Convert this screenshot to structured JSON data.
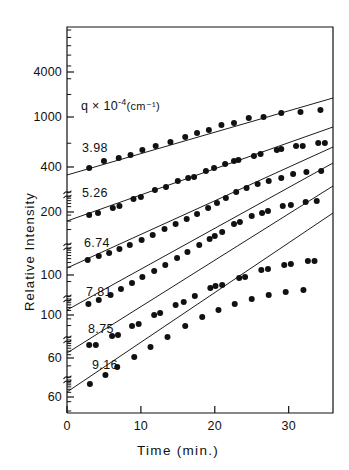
{
  "figure": {
    "background_color": "#ffffff",
    "ink_color": "#111111"
  },
  "chart_data": {
    "type": "scatter",
    "title": "",
    "subtitle": "",
    "xlabel": "Time   (min.)",
    "ylabel": "Relative  Intensity",
    "legend_header": "q × 10⁻⁴ (cm⁻¹)",
    "legend_position": "inside-upper-left",
    "grid": false,
    "yscale": "log-stacked-offset",
    "xscale": "linear",
    "xlim": [
      0,
      36
    ],
    "x_ticks": [
      0,
      10,
      20,
      30
    ],
    "x_tick_labels": [
      "0",
      "10",
      "20",
      "30"
    ],
    "y_tick_labels": [
      "4000",
      "1000",
      "400",
      "200",
      "100",
      "100",
      "60",
      "60"
    ],
    "y_tick_pixel_y": [
      72,
      117,
      167,
      212,
      275,
      315,
      358,
      397
    ],
    "axis_break_pixel_y": [
      192,
      244,
      296,
      337,
      377
    ],
    "series": [
      {
        "name": "3.98",
        "label": "3.98",
        "q_value": 3.98,
        "fit_line": {
          "x0": 0,
          "y0_px": 175,
          "x1": 36,
          "y1_px": 98
        },
        "points": [
          {
            "x": 3.0,
            "y_px": 168
          },
          {
            "x": 5.0,
            "y_px": 161
          },
          {
            "x": 7.0,
            "y_px": 158
          },
          {
            "x": 8.6,
            "y_px": 155
          },
          {
            "x": 10.2,
            "y_px": 150
          },
          {
            "x": 12.0,
            "y_px": 146
          },
          {
            "x": 14.0,
            "y_px": 142
          },
          {
            "x": 16.0,
            "y_px": 137
          },
          {
            "x": 17.6,
            "y_px": 133
          },
          {
            "x": 19.2,
            "y_px": 130
          },
          {
            "x": 20.9,
            "y_px": 125
          },
          {
            "x": 22.6,
            "y_px": 123
          },
          {
            "x": 24.6,
            "y_px": 118
          },
          {
            "x": 26.6,
            "y_px": 117
          },
          {
            "x": 29.0,
            "y_px": 113
          },
          {
            "x": 31.6,
            "y_px": 112
          },
          {
            "x": 34.3,
            "y_px": 110
          }
        ]
      },
      {
        "name": "5.26",
        "label": "5.26",
        "q_value": 5.26,
        "fit_line": {
          "x0": 0,
          "y0_px": 221,
          "x1": 36,
          "y1_px": 127
        },
        "points": [
          {
            "x": 3.0,
            "y_px": 215
          },
          {
            "x": 4.2,
            "y_px": 213
          },
          {
            "x": 6.2,
            "y_px": 208
          },
          {
            "x": 7.1,
            "y_px": 206
          },
          {
            "x": 9.0,
            "y_px": 199
          },
          {
            "x": 10.0,
            "y_px": 197
          },
          {
            "x": 11.9,
            "y_px": 190
          },
          {
            "x": 13.4,
            "y_px": 187
          },
          {
            "x": 15.0,
            "y_px": 181
          },
          {
            "x": 16.4,
            "y_px": 178
          },
          {
            "x": 17.2,
            "y_px": 177
          },
          {
            "x": 18.8,
            "y_px": 171
          },
          {
            "x": 19.9,
            "y_px": 168
          },
          {
            "x": 21.4,
            "y_px": 164
          },
          {
            "x": 22.6,
            "y_px": 161
          },
          {
            "x": 23.2,
            "y_px": 160
          },
          {
            "x": 25.3,
            "y_px": 156
          },
          {
            "x": 26.2,
            "y_px": 154
          },
          {
            "x": 28.4,
            "y_px": 150
          },
          {
            "x": 29.0,
            "y_px": 149
          },
          {
            "x": 31.0,
            "y_px": 146
          },
          {
            "x": 31.9,
            "y_px": 146
          },
          {
            "x": 34.0,
            "y_px": 143
          },
          {
            "x": 34.9,
            "y_px": 143
          }
        ]
      },
      {
        "name": "6.74",
        "label": "6.74",
        "q_value": 6.74,
        "fit_line": {
          "x0": 0,
          "y0_px": 268,
          "x1": 36,
          "y1_px": 147
        },
        "points": [
          {
            "x": 2.8,
            "y_px": 260
          },
          {
            "x": 4.3,
            "y_px": 256
          },
          {
            "x": 5.7,
            "y_px": 253
          },
          {
            "x": 7.1,
            "y_px": 249
          },
          {
            "x": 8.5,
            "y_px": 245
          },
          {
            "x": 10.1,
            "y_px": 240
          },
          {
            "x": 11.6,
            "y_px": 235
          },
          {
            "x": 13.2,
            "y_px": 229
          },
          {
            "x": 14.7,
            "y_px": 224
          },
          {
            "x": 16.2,
            "y_px": 219
          },
          {
            "x": 17.6,
            "y_px": 214
          },
          {
            "x": 19.1,
            "y_px": 208
          },
          {
            "x": 20.3,
            "y_px": 203
          },
          {
            "x": 21.5,
            "y_px": 198
          },
          {
            "x": 22.9,
            "y_px": 192
          },
          {
            "x": 24.3,
            "y_px": 188
          },
          {
            "x": 25.8,
            "y_px": 184
          },
          {
            "x": 27.3,
            "y_px": 181
          },
          {
            "x": 29.0,
            "y_px": 178
          },
          {
            "x": 30.6,
            "y_px": 174
          },
          {
            "x": 32.4,
            "y_px": 172
          },
          {
            "x": 34.4,
            "y_px": 171
          }
        ]
      },
      {
        "name": "7.81",
        "label": "7.81",
        "q_value": 7.81,
        "fit_line": {
          "x0": 0,
          "y0_px": 310,
          "x1": 36,
          "y1_px": 163
        },
        "points": [
          {
            "x": 2.9,
            "y_px": 304
          },
          {
            "x": 4.3,
            "y_px": 300
          },
          {
            "x": 5.9,
            "y_px": 295
          },
          {
            "x": 7.3,
            "y_px": 289
          },
          {
            "x": 8.8,
            "y_px": 283
          },
          {
            "x": 10.2,
            "y_px": 277
          },
          {
            "x": 11.8,
            "y_px": 271
          },
          {
            "x": 13.3,
            "y_px": 265
          },
          {
            "x": 14.9,
            "y_px": 258
          },
          {
            "x": 16.3,
            "y_px": 252
          },
          {
            "x": 17.9,
            "y_px": 245
          },
          {
            "x": 19.3,
            "y_px": 239
          },
          {
            "x": 20.0,
            "y_px": 236
          },
          {
            "x": 21.0,
            "y_px": 232
          },
          {
            "x": 22.6,
            "y_px": 224
          },
          {
            "x": 23.4,
            "y_px": 222
          },
          {
            "x": 25.0,
            "y_px": 216
          },
          {
            "x": 26.4,
            "y_px": 213
          },
          {
            "x": 27.2,
            "y_px": 211
          },
          {
            "x": 29.2,
            "y_px": 206
          },
          {
            "x": 30.3,
            "y_px": 205
          },
          {
            "x": 32.3,
            "y_px": 202
          },
          {
            "x": 33.8,
            "y_px": 201
          }
        ]
      },
      {
        "name": "8.75",
        "label": "8.75",
        "q_value": 8.75,
        "fit_line": {
          "x0": 0,
          "y0_px": 353,
          "x1": 36,
          "y1_px": 186
        },
        "points": [
          {
            "x": 3.0,
            "y_px": 345
          },
          {
            "x": 3.9,
            "y_px": 345
          },
          {
            "x": 6.1,
            "y_px": 336
          },
          {
            "x": 6.9,
            "y_px": 335
          },
          {
            "x": 8.8,
            "y_px": 326
          },
          {
            "x": 9.7,
            "y_px": 324
          },
          {
            "x": 11.8,
            "y_px": 315
          },
          {
            "x": 12.6,
            "y_px": 313
          },
          {
            "x": 14.7,
            "y_px": 305
          },
          {
            "x": 15.8,
            "y_px": 302
          },
          {
            "x": 17.3,
            "y_px": 296
          },
          {
            "x": 19.4,
            "y_px": 288
          },
          {
            "x": 20.1,
            "y_px": 286
          },
          {
            "x": 21.0,
            "y_px": 285
          },
          {
            "x": 23.3,
            "y_px": 278
          },
          {
            "x": 24.1,
            "y_px": 277
          },
          {
            "x": 26.3,
            "y_px": 270
          },
          {
            "x": 27.2,
            "y_px": 269
          },
          {
            "x": 29.4,
            "y_px": 265
          },
          {
            "x": 30.3,
            "y_px": 264
          },
          {
            "x": 32.6,
            "y_px": 261
          },
          {
            "x": 33.5,
            "y_px": 261
          }
        ]
      },
      {
        "name": "9.16",
        "label": "9.16",
        "q_value": 9.16,
        "fit_line": {
          "x0": 0,
          "y0_px": 392,
          "x1": 36,
          "y1_px": 213
        },
        "points": [
          {
            "x": 3.1,
            "y_px": 384
          },
          {
            "x": 5.2,
            "y_px": 375
          },
          {
            "x": 6.8,
            "y_px": 367
          },
          {
            "x": 9.1,
            "y_px": 357
          },
          {
            "x": 11.3,
            "y_px": 347
          },
          {
            "x": 13.6,
            "y_px": 337
          },
          {
            "x": 16.0,
            "y_px": 326
          },
          {
            "x": 18.3,
            "y_px": 317
          },
          {
            "x": 20.5,
            "y_px": 310
          },
          {
            "x": 22.7,
            "y_px": 304
          },
          {
            "x": 25.0,
            "y_px": 299
          },
          {
            "x": 27.3,
            "y_px": 295
          },
          {
            "x": 29.6,
            "y_px": 292
          },
          {
            "x": 32.0,
            "y_px": 290
          }
        ]
      }
    ]
  },
  "legend": {
    "header_prefix": "q × 10",
    "header_exponent": "-4",
    "header_unit": "(cm⁻¹)"
  },
  "axes": {
    "x_title": "Time   (min.)",
    "y_title": "Relative  Intensity"
  }
}
